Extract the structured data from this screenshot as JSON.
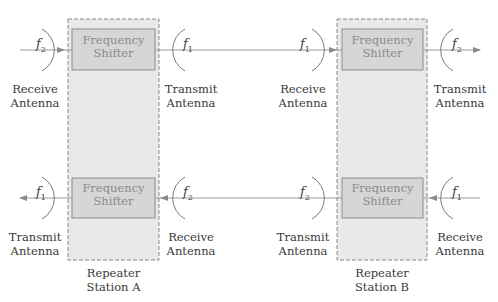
{
  "diagram": {
    "stations": [
      {
        "id": "A",
        "label_line1": "Repeater",
        "label_line2": "Station A"
      },
      {
        "id": "B",
        "label_line1": "Repeater",
        "label_line2": "Station B"
      }
    ],
    "shifter_label_line1": "Frequency",
    "shifter_label_line2": "Shifter",
    "antenna": {
      "receive_line1": "Receive",
      "transmit_line1": "Transmit",
      "line2": "Antenna"
    },
    "frequencies": {
      "f1": {
        "sym": "f",
        "sub": "1"
      },
      "f2": {
        "sym": "f",
        "sub": "2"
      }
    },
    "colors": {
      "station_fill": "#e9e9e9",
      "station_border": "#8a8a8a",
      "shifter_fill": "#d6d6d6",
      "shifter_border": "#8c8c8c",
      "line": "#9a9a9a"
    }
  }
}
